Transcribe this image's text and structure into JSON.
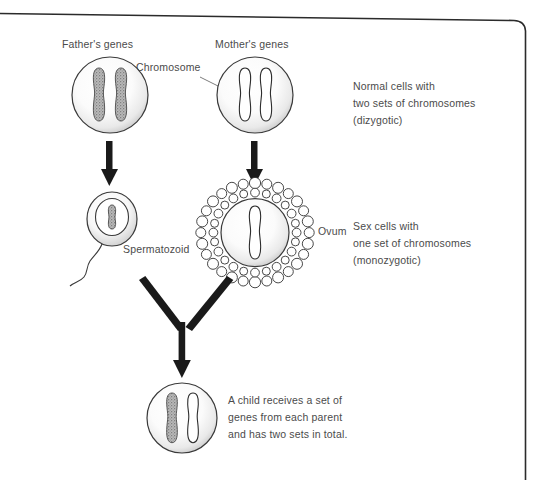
{
  "diagram": {
    "background_color": "#ffffff",
    "text_color": "#4b4b4b",
    "ink_color": "#1a1a1a"
  },
  "frame": {
    "name": "page-border",
    "style": "thin rounded page frame, top edge and right edge visible"
  },
  "labels": {
    "fathers_genes": "Father's genes",
    "mothers_genes": "Mother's genes",
    "chromosome": "Chromosome",
    "spermatozoid": "Spermatozoid",
    "ovum": "Ovum"
  },
  "annotations": {
    "normal_cells": {
      "line1": "Normal cells with",
      "line2": "two sets of chromosomes",
      "line3": "(dizygotic)"
    },
    "sex_cells": {
      "line1": "Sex cells with",
      "line2": "one set of chromosomes",
      "line3": "(monozygotic)"
    },
    "child_cell": {
      "line1": "A child receives a set of",
      "line2": "genes from each parent",
      "line3": "and has two sets in total."
    }
  },
  "cells": {
    "father": {
      "name": "father-cell",
      "chromosome_count": 2,
      "chromosome_style": "shaded",
      "shape": "circle"
    },
    "mother": {
      "name": "mother-cell",
      "chromosome_count": 2,
      "chromosome_style": "outline",
      "shape": "circle"
    },
    "spermatozoid": {
      "name": "spermatozoid-cell",
      "chromosome_count": 1,
      "chromosome_style": "shaded",
      "shape": "oval-with-tail"
    },
    "ovum": {
      "name": "ovum-cell",
      "chromosome_count": 1,
      "chromosome_style": "outline",
      "shape": "circle-with-corona"
    },
    "child": {
      "name": "child-cell",
      "chromosome_count": 2,
      "chromosome_style": "one-shaded-one-outline",
      "shape": "circle"
    }
  },
  "arrows": {
    "father_to_sperm": "down-arrow",
    "mother_to_ovum": "down-arrow",
    "fusion": "y-merge-arrow"
  }
}
